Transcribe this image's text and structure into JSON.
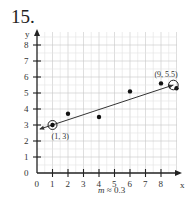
{
  "problem": {
    "number": "15."
  },
  "chart_data": {
    "type": "scatter",
    "title": "",
    "xlabel": "x",
    "ylabel": "y",
    "xlim": [
      0,
      9
    ],
    "ylim": [
      0,
      8.5
    ],
    "x_ticks": [
      "0",
      "1",
      "2",
      "3",
      "4",
      "5",
      "6",
      "7",
      "8"
    ],
    "y_ticks": [
      "0",
      "1",
      "2",
      "3",
      "4",
      "5",
      "6",
      "7",
      "8"
    ],
    "grid": true,
    "points": [
      {
        "x": 1,
        "y": 3
      },
      {
        "x": 2,
        "y": 3.7
      },
      {
        "x": 4,
        "y": 3.5
      },
      {
        "x": 6,
        "y": 5.1
      },
      {
        "x": 8,
        "y": 5.6
      },
      {
        "x": 9,
        "y": 5.3
      }
    ],
    "trend_line": {
      "from": {
        "x": 0.2,
        "y": 2.75
      },
      "to": {
        "x": 8.8,
        "y": 5.5
      },
      "arrows": "both"
    },
    "highlighted_points": [
      {
        "x": 1,
        "y": 3,
        "label": "(1, 3)"
      },
      {
        "x": 8.8,
        "y": 5.5,
        "label": "(9, 5.5)"
      }
    ],
    "annotation": "m ≈ 0.3"
  },
  "caption": {
    "slope_var": "m",
    "slope_rest": " ≈ 0.3"
  }
}
